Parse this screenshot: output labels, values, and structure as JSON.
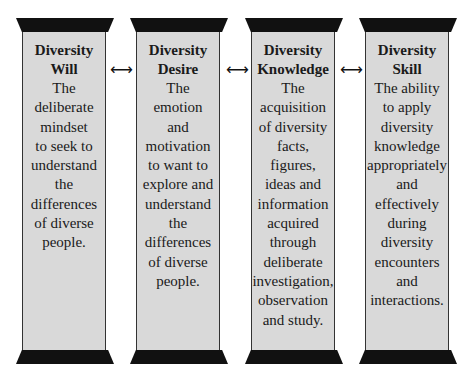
{
  "pillars": [
    {
      "title_line1": "Diversity",
      "title_line2": "Will",
      "lines": [
        "The",
        "deliberate",
        "mindset",
        "to seek to",
        "understand",
        "the",
        "differences",
        "of diverse",
        "people."
      ]
    },
    {
      "title_line1": "Diversity",
      "title_line2": "Desire",
      "lines": [
        "The",
        "emotion",
        "and",
        "motivation",
        "to want to",
        "explore and",
        "understand",
        "the",
        "differences",
        "of diverse",
        "people."
      ]
    },
    {
      "title_line1": "Diversity",
      "title_line2": "Knowledge",
      "lines": [
        "The",
        "acquisition",
        "of diversity",
        "facts,",
        "figures,",
        "ideas and",
        "information",
        "acquired",
        "through",
        "deliberate",
        "investigation,",
        "observation",
        "and study."
      ]
    },
    {
      "title_line1": "Diversity",
      "title_line2": "Skill",
      "lines": [
        "The ability",
        "to apply",
        "diversity",
        "knowledge",
        "appropriately",
        "and",
        "effectively",
        "during",
        "diversity",
        "encounters",
        "and",
        "interactions."
      ]
    }
  ],
  "connectors": {
    "arrow_glyph": "⟷",
    "icon": "double-headed-arrow-icon"
  },
  "colors": {
    "pillar_fill": "#d9d9d9",
    "cap_fill": "#111111",
    "background": "#ffffff"
  }
}
